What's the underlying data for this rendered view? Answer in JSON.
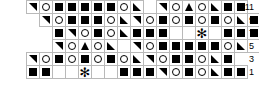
{
  "chart": {
    "columns": 16,
    "rows": 6,
    "cell_size_px": 14,
    "grid_line_color": "#b9b9b9",
    "symbol_color": "#000000",
    "background_color": "#ffffff",
    "legend": {
      "filled-square": "sq",
      "open-circle": "ci",
      "triangle-upper-left": "tu",
      "triangle-lower-left": "tl",
      "triangle-up": "tc",
      "triangle-lower-right": "tr",
      "asterisk": "as",
      "empty-cell": "empty",
      "no-cell": "blank"
    },
    "rows_data": [
      {
        "label": "11",
        "offset_cells": 2,
        "cells": [
          "tu",
          "ci",
          "sq",
          "sq",
          "sq",
          "sq",
          "sq",
          "ci",
          "tl",
          "blank",
          "tu",
          "ci",
          "tc",
          "ci",
          "tl",
          "sq",
          "sq"
        ]
      },
      {
        "label": "9",
        "offset_cells": 3,
        "cells": [
          "tu",
          "ci",
          "sq",
          "sq",
          "sq",
          "ci",
          "tl",
          "tu",
          "ci",
          "sq",
          "ci",
          "sq",
          "ci",
          "sq",
          "ci",
          "tl",
          "sq"
        ]
      },
      {
        "label": "7",
        "offset_cells": 4,
        "cells": [
          "sq",
          "tu",
          "ci",
          "sq",
          "ci",
          "tl",
          "sq",
          "sq",
          "sq",
          "empty",
          "empty",
          "as",
          "empty",
          "sq",
          "sq",
          "sq"
        ]
      },
      {
        "label": "5",
        "offset_cells": 4,
        "cells": [
          "tu",
          "ci",
          "tc",
          "ci",
          "tl",
          "blank",
          "tu",
          "ci",
          "sq",
          "sq",
          "sq",
          "sq",
          "sq",
          "ci",
          "tl",
          "empty"
        ]
      },
      {
        "label": "3",
        "offset_cells": 2,
        "cells": [
          "tu",
          "ci",
          "sq",
          "ci",
          "sq",
          "ci",
          "sq",
          "ci",
          "tl",
          "tu",
          "ci",
          "sq",
          "sq",
          "ci",
          "tl",
          "sq"
        ]
      },
      {
        "label": "1",
        "offset_cells": 2,
        "cells": [
          "sq",
          "sq",
          "empty",
          "empty",
          "as",
          "empty",
          "empty",
          "sq",
          "sq",
          "sq",
          "tu",
          "ci",
          "sq",
          "ci",
          "tl",
          "sq",
          "sq"
        ]
      }
    ],
    "row_labels": [
      "11",
      "9",
      "7",
      "5",
      "3",
      "1"
    ]
  }
}
